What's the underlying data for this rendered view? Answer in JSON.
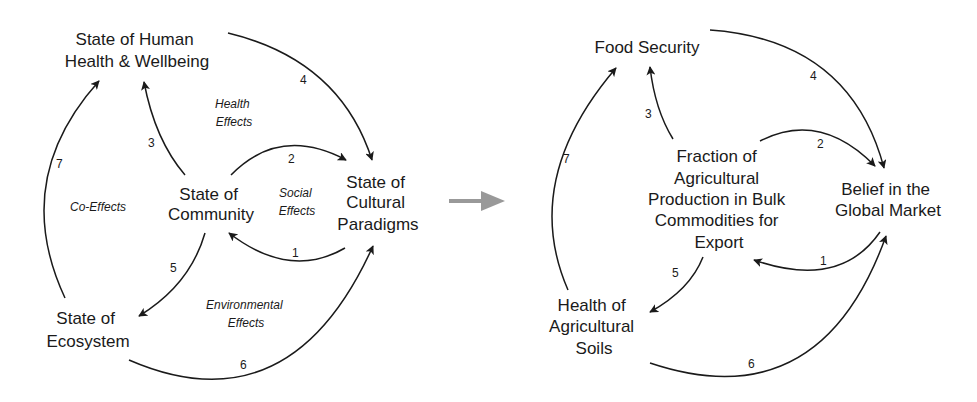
{
  "left_diagram": {
    "nodes": {
      "human_health": [
        "State of Human",
        "Health & Wellbeing"
      ],
      "community": [
        "State of",
        "Community"
      ],
      "cultural": [
        "State of",
        "Cultural",
        "Paradigms"
      ],
      "ecosystem": [
        "State of",
        "Ecosystem"
      ]
    },
    "effects": {
      "health": [
        "Health",
        "Effects"
      ],
      "social": [
        "Social",
        "Effects"
      ],
      "co": "Co-Effects",
      "environmental": [
        "Environmental",
        "Effects"
      ]
    },
    "edges": [
      "1",
      "2",
      "3",
      "4",
      "5",
      "6",
      "7"
    ]
  },
  "transition_arrow": {
    "color": "#999999"
  },
  "right_diagram": {
    "nodes": {
      "food_security": "Food Security",
      "fraction": [
        "Fraction of",
        "Agricultural",
        "Production in Bulk",
        "Commodities for",
        "Export"
      ],
      "belief": [
        "Belief in the",
        "Global Market"
      ],
      "soils": [
        "Health of",
        "Agricultural",
        "Soils"
      ]
    },
    "edges": [
      "1",
      "2",
      "3",
      "4",
      "5",
      "6",
      "7"
    ]
  }
}
